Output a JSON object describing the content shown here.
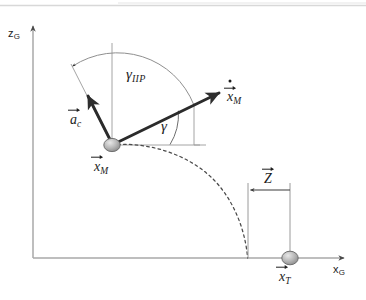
{
  "figure": {
    "background_color": "#ffffff",
    "line_color": "#3c3c3c",
    "axis_color": "#a8a8a8",
    "body_fill_color": "#b4b4b4",
    "scan_artifact_color": "#cfcfcf"
  },
  "axes": {
    "vertical": {
      "name": "z-axis",
      "label_base": "z",
      "label_sub": "G",
      "label_full": "zG",
      "origin": [
        33,
        258
      ],
      "tip": [
        33,
        22
      ]
    },
    "horizontal": {
      "name": "x-axis",
      "label_base": "x",
      "label_sub": "G",
      "label_full": "xG",
      "origin": [
        33,
        258
      ],
      "tip": [
        348,
        258
      ]
    }
  },
  "bodies": [
    {
      "name": "missile",
      "label_base": "x",
      "label_sub": "M",
      "label_full": "xM",
      "accent": "vector-arrow",
      "position": [
        112,
        145
      ]
    },
    {
      "name": "target",
      "label_base": "x",
      "label_sub": "T",
      "label_full": "xT",
      "accent": "vector-arrow",
      "position": [
        290,
        258
      ]
    }
  ],
  "vectors": [
    {
      "name": "missile-velocity",
      "label_base": "x",
      "label_sub": "M",
      "label_full": "xM",
      "accent": "vector-arrow-with-dot",
      "description": "missile velocity vector",
      "from": [
        112,
        145
      ],
      "to": [
        222,
        92
      ]
    },
    {
      "name": "commanded-acceleration",
      "label_base": "a",
      "label_sub": "c",
      "label_full": "ac",
      "accent": "vector-arrow",
      "description": "commanded acceleration vector",
      "from": [
        112,
        145
      ],
      "to": [
        87,
        95
      ]
    },
    {
      "name": "zero-effort-miss",
      "label_base": "Z",
      "label_sub": "",
      "label_full": "Z",
      "accent": "vector-arrow",
      "description": "zero-effort-miss distance between predicted impact point and target",
      "from": [
        290,
        190
      ],
      "to": [
        248,
        190
      ]
    }
  ],
  "angles": [
    {
      "name": "gamma-iip",
      "symbol": "γ",
      "subscript": "IIP",
      "label_full": "γIIP",
      "description": "angle from commanded acceleration direction to velocity vector",
      "vertex": [
        112,
        145
      ],
      "arc_radius": 82,
      "label_position": [
        127,
        70
      ]
    },
    {
      "name": "gamma",
      "symbol": "γ",
      "subscript": "",
      "label_full": "γ",
      "description": "flight path angle from horizontal to velocity vector",
      "vertex": [
        112,
        145
      ],
      "arc_radius": 58,
      "label_position": [
        164,
        124
      ]
    }
  ],
  "curves": [
    {
      "name": "predicted-trajectory",
      "style": "dashed",
      "description": "predicted ballistic trajectory from missile to predicted impact point",
      "start": [
        112,
        145
      ],
      "end": [
        248,
        258
      ]
    }
  ],
  "dimension_lines": [
    {
      "name": "impact-point-extension",
      "from": [
        248,
        183
      ],
      "to": [
        248,
        258
      ]
    },
    {
      "name": "target-extension",
      "from": [
        290,
        183
      ],
      "to": [
        290,
        258
      ]
    }
  ]
}
